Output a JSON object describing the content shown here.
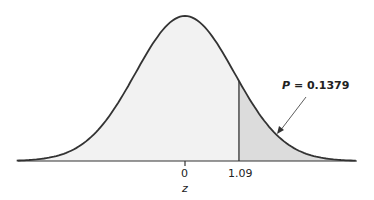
{
  "chart_data": {
    "type": "area",
    "title": "",
    "xlabel": "z",
    "ylabel": "",
    "x_ticks": [
      "0",
      "1.09"
    ],
    "mean": 0,
    "sd": 1,
    "shaded_region": {
      "from": 1.09,
      "to": "inf",
      "probability": 0.1379
    },
    "annotation": "P = 0.1379",
    "grid": false,
    "legend": null,
    "colors": {
      "curve": "#333333",
      "body_fill": "#f2f2f2",
      "tail_fill": "#dcdcdc"
    }
  },
  "labels": {
    "tick_zero": "0",
    "tick_z": "1.09",
    "axis_label": "z",
    "p_label": "P",
    "p_value": " = 0.1379"
  }
}
